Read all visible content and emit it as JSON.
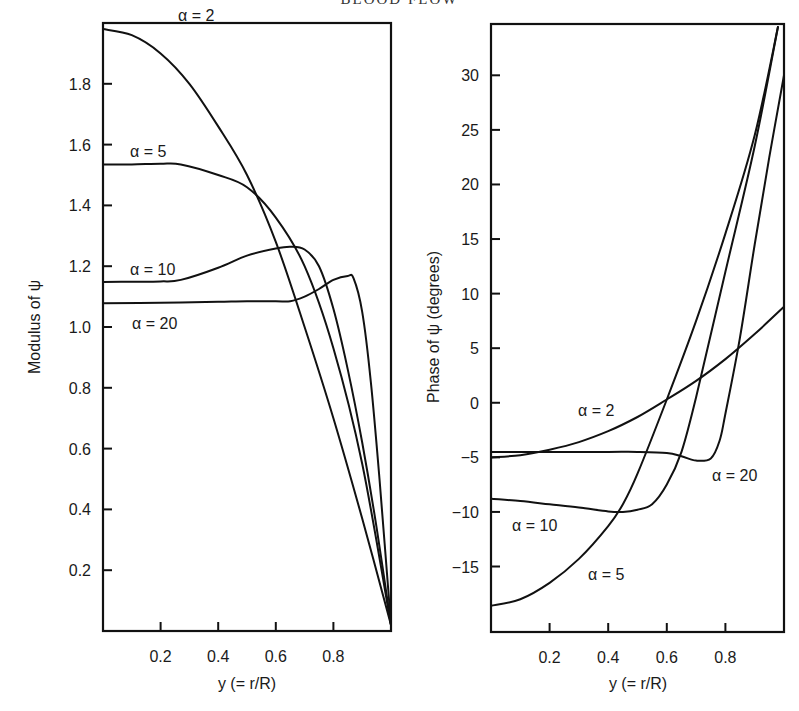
{
  "header": {
    "title": "BLOOD FLOW"
  },
  "chart_data": [
    {
      "type": "line",
      "title": "",
      "xlabel": "y (= r/R)",
      "ylabel": "Modulus of ψ",
      "xlim": [
        0,
        1
      ],
      "ylim": [
        0,
        2.0
      ],
      "xticks": [
        "0.2",
        "0.4",
        "0.6",
        "0.8"
      ],
      "yticks": [
        "0.2",
        "0.4",
        "0.6",
        "0.8",
        "1.0",
        "1.2",
        "1.4",
        "1.6",
        "1.8"
      ],
      "grid": false,
      "legend": "inline labels",
      "series": [
        {
          "name": "α = 2",
          "x": [
            0,
            0.1,
            0.2,
            0.3,
            0.4,
            0.5,
            0.6,
            0.7,
            0.8,
            0.9,
            1.0
          ],
          "values": [
            1.98,
            1.96,
            1.9,
            1.8,
            1.66,
            1.5,
            1.28,
            1.0,
            0.7,
            0.37,
            0.02
          ]
        },
        {
          "name": "α = 5",
          "x": [
            0,
            0.1,
            0.2,
            0.27,
            0.4,
            0.5,
            0.6,
            0.7,
            0.8,
            0.9,
            1.0
          ],
          "values": [
            1.535,
            1.535,
            1.537,
            1.535,
            1.5,
            1.46,
            1.36,
            1.2,
            0.93,
            0.55,
            0.02
          ]
        },
        {
          "name": "α = 10",
          "x": [
            0,
            0.1,
            0.2,
            0.27,
            0.4,
            0.5,
            0.6,
            0.65,
            0.7,
            0.75,
            0.8,
            0.85,
            0.9,
            0.95,
            1.0
          ],
          "values": [
            1.148,
            1.149,
            1.15,
            1.155,
            1.195,
            1.235,
            1.258,
            1.264,
            1.255,
            1.2,
            1.06,
            0.86,
            0.62,
            0.34,
            0.02
          ]
        },
        {
          "name": "α = 20",
          "x": [
            0,
            0.2,
            0.4,
            0.5,
            0.6,
            0.65,
            0.7,
            0.75,
            0.8,
            0.85,
            0.87,
            0.9,
            0.93,
            0.96,
            1.0
          ],
          "values": [
            1.078,
            1.08,
            1.083,
            1.085,
            1.085,
            1.085,
            1.1,
            1.125,
            1.155,
            1.168,
            1.16,
            1.05,
            0.82,
            0.5,
            0.02
          ]
        }
      ],
      "annotations": [
        "α = 2",
        "α = 5",
        "α = 10",
        "α = 20"
      ]
    },
    {
      "type": "line",
      "title": "",
      "xlabel": "y (= r/R)",
      "ylabel": "Phase of ψ (degrees)",
      "xlim": [
        0,
        1
      ],
      "ylim": [
        -21,
        34.7
      ],
      "xticks": [
        "0.2",
        "0.4",
        "0.6",
        "0.8"
      ],
      "yticks": [
        "−15",
        "−10",
        "−5",
        "0",
        "5",
        "10",
        "15",
        "20",
        "25",
        "30"
      ],
      "grid": false,
      "legend": "inline labels",
      "series": [
        {
          "name": "α = 2",
          "x": [
            0,
            0.1,
            0.2,
            0.3,
            0.4,
            0.5,
            0.6,
            0.7,
            0.8,
            0.9,
            1.0
          ],
          "values": [
            -5.0,
            -4.8,
            -4.3,
            -3.6,
            -2.6,
            -1.3,
            0.3,
            2.0,
            4.0,
            6.3,
            8.8
          ]
        },
        {
          "name": "α = 5",
          "x": [
            0,
            0.1,
            0.2,
            0.3,
            0.4,
            0.45,
            0.5,
            0.6,
            0.7,
            0.8,
            0.9,
            0.98
          ],
          "values": [
            -18.6,
            -18.0,
            -16.5,
            -14.3,
            -11.3,
            -9.3,
            -6.5,
            0.3,
            7.5,
            15.5,
            24.5,
            34.5
          ]
        },
        {
          "name": "α = 10",
          "x": [
            0,
            0.1,
            0.2,
            0.3,
            0.4,
            0.45,
            0.5,
            0.55,
            0.6,
            0.65,
            0.7,
            0.8,
            0.9,
            0.98
          ],
          "values": [
            -8.8,
            -9.0,
            -9.3,
            -9.6,
            -9.95,
            -10.0,
            -9.8,
            -9.3,
            -7.5,
            -4.5,
            0.5,
            12.0,
            23.5,
            34.5
          ]
        },
        {
          "name": "α = 20",
          "x": [
            0,
            0.2,
            0.4,
            0.5,
            0.6,
            0.65,
            0.7,
            0.75,
            0.78,
            0.8,
            0.85,
            0.9,
            0.95,
            1.0
          ],
          "values": [
            -4.5,
            -4.5,
            -4.5,
            -4.5,
            -4.6,
            -4.9,
            -5.3,
            -5.1,
            -3.5,
            -1.0,
            6.0,
            14.5,
            22.5,
            30.0
          ]
        }
      ],
      "annotations": [
        "α = 2",
        "α = 5",
        "α = 10",
        "α = 20"
      ]
    }
  ],
  "labels": {
    "left": {
      "xlabel": "y (= r/R)",
      "ylabel": "Modulus of ψ",
      "a2": "α = 2",
      "a5": "α = 5",
      "a10": "α = 10",
      "a20": "α = 20"
    },
    "right": {
      "xlabel": "y (= r/R)",
      "ylabel": "Phase of ψ (degrees)",
      "a2": "α = 2",
      "a5": "α = 5",
      "a10": "α = 10",
      "a20": "α = 20"
    }
  }
}
